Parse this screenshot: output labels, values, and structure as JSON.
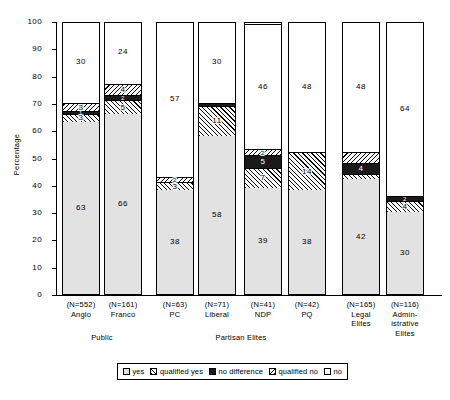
{
  "chart_data": {
    "type": "bar",
    "subtype": "stacked-bar-100",
    "title": "",
    "xlabel": "",
    "ylabel": "Percentage",
    "ylim": [
      0,
      100
    ],
    "yticks": [
      0,
      10,
      20,
      30,
      40,
      50,
      60,
      70,
      80,
      90,
      100
    ],
    "grid": false,
    "legend_position": "bottom",
    "series": [
      {
        "name": "yes",
        "key": "yes",
        "pattern": "solid-light-gray",
        "values": [
          63,
          66,
          38,
          58,
          39,
          38,
          42,
          30
        ]
      },
      {
        "name": "qualified yes",
        "key": "qyes",
        "pattern": "hatched",
        "values": [
          3,
          5,
          3,
          11,
          7,
          14,
          2,
          4
        ]
      },
      {
        "name": "no difference",
        "key": "nodiff",
        "pattern": "solid-black",
        "values": [
          1,
          2,
          0,
          1,
          5,
          0,
          4,
          2
        ]
      },
      {
        "name": "qualified no",
        "key": "qno",
        "pattern": "hatched",
        "values": [
          3,
          4,
          2,
          0,
          2,
          0,
          4,
          0
        ]
      },
      {
        "name": "no",
        "key": "no",
        "pattern": "solid-white",
        "values": [
          30,
          24,
          57,
          30,
          46,
          48,
          48,
          64
        ]
      }
    ],
    "categories": [
      {
        "n": "(N=552)",
        "label": "Anglo",
        "group": "Public"
      },
      {
        "n": "(N=161)",
        "label": "Franco",
        "group": "Public"
      },
      {
        "n": "(N=63)",
        "label": "PC",
        "group": "Partisan Elites"
      },
      {
        "n": "(N=71)",
        "label": "Liberal",
        "group": "Partisan Elites"
      },
      {
        "n": "(N=41)",
        "label": "NDP",
        "group": "Partisan Elites"
      },
      {
        "n": "(N=42)",
        "label": "PQ",
        "group": "Partisan Elites"
      },
      {
        "n": "(N=165)",
        "label": "Legal\nElites",
        "group": ""
      },
      {
        "n": "(N=116)",
        "label": "Admin-\nistrative\nElites",
        "group": ""
      }
    ],
    "supergroups": [
      {
        "label": "Public",
        "from": 0,
        "to": 1
      },
      {
        "label": "Partisan Elites",
        "from": 2,
        "to": 5
      }
    ],
    "bar_labels": [
      {
        "category": "Anglo",
        "segments": [
          {
            "name": "yes",
            "value": "63"
          },
          {
            "name": "qualified yes",
            "value": "3"
          },
          {
            "name": "no difference",
            "value": "1"
          },
          {
            "name": "qualified no",
            "value": "3"
          },
          {
            "name": "no",
            "value": "30"
          }
        ]
      },
      {
        "category": "Franco",
        "segments": [
          {
            "name": "yes",
            "value": "66"
          },
          {
            "name": "qualified yes",
            "value": "5"
          },
          {
            "name": "no difference",
            "value": "2"
          },
          {
            "name": "qualified no",
            "value": "4"
          },
          {
            "name": "no",
            "value": "24"
          }
        ]
      },
      {
        "category": "PC",
        "segments": [
          {
            "name": "yes",
            "value": "38"
          },
          {
            "name": "qualified yes",
            "value": "3"
          },
          {
            "name": "no difference",
            "value": ""
          },
          {
            "name": "qualified no",
            "value": "2"
          },
          {
            "name": "no",
            "value": "57"
          }
        ]
      },
      {
        "category": "Liberal",
        "segments": [
          {
            "name": "yes",
            "value": "58"
          },
          {
            "name": "qualified yes",
            "value": "11"
          },
          {
            "name": "no difference",
            "value": ""
          },
          {
            "name": "qualified no",
            "value": ""
          },
          {
            "name": "no",
            "value": "30"
          }
        ]
      },
      {
        "category": "NDP",
        "segments": [
          {
            "name": "yes",
            "value": "39"
          },
          {
            "name": "qualified yes",
            "value": "7"
          },
          {
            "name": "no difference",
            "value": "5"
          },
          {
            "name": "qualified no",
            "value": "2"
          },
          {
            "name": "no",
            "value": "46"
          }
        ]
      },
      {
        "category": "PQ",
        "segments": [
          {
            "name": "yes",
            "value": "38"
          },
          {
            "name": "qualified yes",
            "value": "14"
          },
          {
            "name": "no difference",
            "value": ""
          },
          {
            "name": "qualified no",
            "value": ""
          },
          {
            "name": "no",
            "value": "48"
          }
        ]
      },
      {
        "category": "Legal Elites",
        "segments": [
          {
            "name": "yes",
            "value": "42"
          },
          {
            "name": "qualified yes",
            "value": ""
          },
          {
            "name": "no difference",
            "value": "4"
          },
          {
            "name": "qualified no",
            "value": ""
          },
          {
            "name": "no",
            "value": "48"
          }
        ]
      },
      {
        "category": "Administrative Elites",
        "segments": [
          {
            "name": "yes",
            "value": "30"
          },
          {
            "name": "qualified yes",
            "value": "4"
          },
          {
            "name": "no difference",
            "value": "2"
          },
          {
            "name": "qualified no",
            "value": ""
          },
          {
            "name": "no",
            "value": "64"
          }
        ]
      }
    ],
    "legend": [
      {
        "label": "yes",
        "key": "yes"
      },
      {
        "label": "qualified yes",
        "key": "qyes"
      },
      {
        "label": "no difference",
        "key": "nodiff"
      },
      {
        "label": "qualified no",
        "key": "qno"
      },
      {
        "label": "no",
        "key": "no"
      }
    ],
    "colors": {
      "yes": "#e2e2e2",
      "no_difference": "#1a1a1a",
      "no": "#ffffff",
      "axis": "#000000",
      "background": "#ffffff"
    }
  }
}
